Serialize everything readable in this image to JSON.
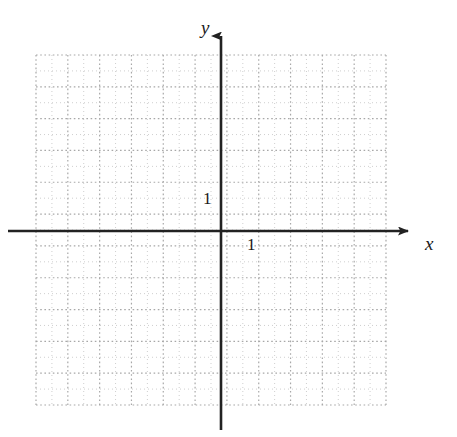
{
  "figure": {
    "background_color": "#ffffff"
  },
  "axes": {
    "x_axis": {
      "label": "x",
      "icon": "arrow-right-icon",
      "color": "#222222",
      "origin_y": 231,
      "start_x": 8,
      "end_x": 415
    },
    "y_axis": {
      "label": "y",
      "icon": "arrow-up-icon",
      "color": "#222222",
      "origin_x": 221,
      "start_y": 28,
      "end_y": 430
    },
    "origin": {
      "x": 221,
      "y": 231
    }
  },
  "ticks": {
    "x_unit_label": "1",
    "y_unit_label": "1",
    "unit_spacing_px": 31.8
  },
  "grid": {
    "style": "dotted",
    "color": "#bfbfbf",
    "left": 36,
    "top": 55,
    "right": 386,
    "bottom": 405,
    "columns": 11,
    "rows": 11,
    "cell_width": 31.8,
    "cell_height": 31.8,
    "minor_dot_spacing": 4
  },
  "chart_data": {
    "type": "scatter",
    "title": "",
    "subtitle": "",
    "xlabel": "x",
    "ylabel": "y",
    "series": [
      {
        "name": "",
        "x": [],
        "y": []
      }
    ],
    "x": [],
    "values": [],
    "categories": [],
    "xlim": [
      -5.8,
      5.2
    ],
    "ylim": [
      -5.5,
      5.5
    ],
    "xticks": [
      1
    ],
    "yticks": [
      1
    ],
    "xticklabels": [
      "1"
    ],
    "yticklabels": [
      "1"
    ],
    "grid": true,
    "grid_style": "dotted",
    "legend": null,
    "legend_position": "none",
    "annotations": [],
    "note": "Empty coordinate plane; no data plotted."
  }
}
